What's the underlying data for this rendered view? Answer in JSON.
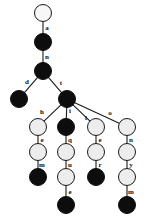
{
  "diagram": {
    "colors": {
      "filled_node": "#0d0d0d",
      "open_node": "#ededed",
      "root_node": "#f7f7f7",
      "edge": "#1a1a1a",
      "label": "#111111",
      "background": "#ffffff"
    },
    "nodes": [
      {
        "id": "n0",
        "label": "",
        "type": "root",
        "x": 43,
        "y": 13,
        "r": 9
      },
      {
        "id": "n1",
        "label": "",
        "type": "filled",
        "x": 43,
        "y": 42,
        "r": 9
      },
      {
        "id": "n2",
        "label": "",
        "type": "filled",
        "x": 43,
        "y": 71,
        "r": 9
      },
      {
        "id": "n3",
        "label": "",
        "type": "filled",
        "x": 19,
        "y": 99,
        "r": 9
      },
      {
        "id": "n4",
        "label": "",
        "type": "filled",
        "x": 67,
        "y": 99,
        "r": 9
      },
      {
        "id": "n5",
        "label": "",
        "type": "open",
        "x": 38,
        "y": 127,
        "r": 9
      },
      {
        "id": "n6",
        "label": "",
        "type": "filled",
        "x": 66,
        "y": 127,
        "r": 9
      },
      {
        "id": "n7",
        "label": "",
        "type": "open",
        "x": 96,
        "y": 127,
        "r": 9
      },
      {
        "id": "n8",
        "label": "",
        "type": "open",
        "x": 127,
        "y": 127,
        "r": 9
      },
      {
        "id": "n9",
        "label": "",
        "type": "open",
        "x": 38,
        "y": 152,
        "r": 9
      },
      {
        "id": "n10",
        "label": "",
        "type": "open",
        "x": 66,
        "y": 152,
        "r": 9
      },
      {
        "id": "n11",
        "label": "",
        "type": "open",
        "x": 96,
        "y": 152,
        "r": 9
      },
      {
        "id": "n12",
        "label": "",
        "type": "open",
        "x": 127,
        "y": 152,
        "r": 9
      },
      {
        "id": "n13",
        "label": "",
        "type": "filled",
        "x": 38,
        "y": 177,
        "r": 9
      },
      {
        "id": "n14",
        "label": "",
        "type": "open",
        "x": 66,
        "y": 177,
        "r": 9
      },
      {
        "id": "n15",
        "label": "",
        "type": "filled",
        "x": 96,
        "y": 177,
        "r": 9
      },
      {
        "id": "n16",
        "label": "",
        "type": "open",
        "x": 127,
        "y": 177,
        "r": 9
      },
      {
        "id": "n17",
        "label": "",
        "type": "filled",
        "x": 66,
        "y": 205,
        "r": 9
      },
      {
        "id": "n18",
        "label": "",
        "type": "filled",
        "x": 127,
        "y": 205,
        "r": 9
      }
    ],
    "edges": [
      {
        "from": "n0",
        "to": "n1",
        "letter": "a",
        "lx": 47,
        "ly": 29
      },
      {
        "from": "n1",
        "to": "n2",
        "letter": "n",
        "lx": 47,
        "ly": 58
      },
      {
        "from": "n2",
        "to": "n3",
        "letter": "d",
        "lx": 27,
        "ly": 83
      },
      {
        "from": "n2",
        "to": "n4",
        "letter": "t",
        "lx": 61,
        "ly": 84
      },
      {
        "from": "n4",
        "to": "n5",
        "letter": "h",
        "lx": 42,
        "ly": 113
      },
      {
        "from": "n4",
        "to": "n6",
        "letter": "i",
        "lx": 70,
        "ly": 112
      },
      {
        "from": "n4",
        "to": "n7",
        "letter": "l",
        "lx": 86,
        "ly": 119
      },
      {
        "from": "n4",
        "to": "n8",
        "letter": "o",
        "lx": 110,
        "ly": 114
      },
      {
        "from": "n5",
        "to": "n9",
        "letter": "e",
        "lx": 42,
        "ly": 141
      },
      {
        "from": "n6",
        "to": "n10",
        "letter": "q",
        "lx": 70,
        "ly": 141
      },
      {
        "from": "n7",
        "to": "n11",
        "letter": "e",
        "lx": 100,
        "ly": 141
      },
      {
        "from": "n8",
        "to": "n12",
        "letter": "n",
        "lx": 131,
        "ly": 141
      },
      {
        "from": "n9",
        "to": "n13",
        "letter": "m",
        "lx": 42,
        "ly": 166
      },
      {
        "from": "n10",
        "to": "n14",
        "letter": "u",
        "lx": 70,
        "ly": 166
      },
      {
        "from": "n11",
        "to": "n15",
        "letter": "r",
        "lx": 100,
        "ly": 166
      },
      {
        "from": "n12",
        "to": "n16",
        "letter": "y",
        "lx": 131,
        "ly": 166
      },
      {
        "from": "n14",
        "to": "n17",
        "letter": "e",
        "lx": 70,
        "ly": 193
      },
      {
        "from": "n16",
        "to": "n18",
        "letter": "m",
        "lx": 131,
        "ly": 193
      }
    ]
  }
}
